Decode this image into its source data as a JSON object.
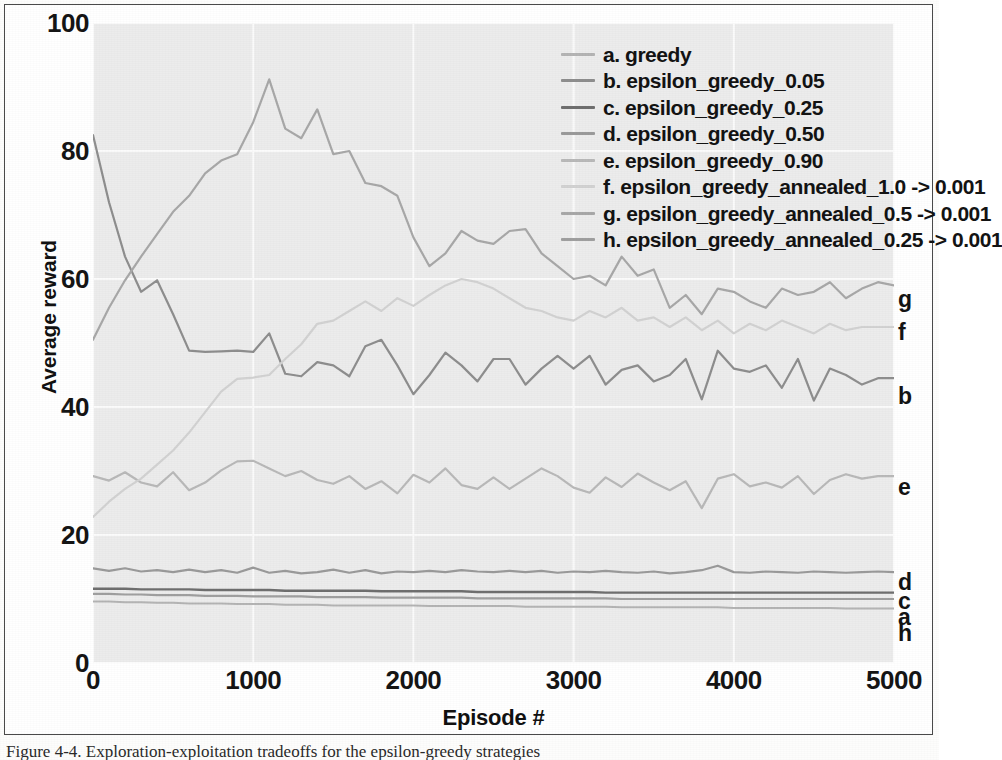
{
  "figure": {
    "caption": "Figure 4-4. Exploration-exploitation tradeoffs for the epsilon-greedy strategies"
  },
  "axes": {
    "x_title": "Episode #",
    "y_title": "Average reward",
    "x_ticks": [
      "0",
      "1000",
      "2000",
      "3000",
      "4000",
      "5000"
    ],
    "y_ticks": [
      "0",
      "20",
      "40",
      "60",
      "80",
      "100"
    ],
    "x_tick_values": [
      0,
      1000,
      2000,
      3000,
      4000,
      5000
    ],
    "y_tick_values": [
      0,
      20,
      40,
      60,
      80,
      100
    ]
  },
  "legend": {
    "entries": [
      {
        "key": "a",
        "label": "a. greedy",
        "color": "#b4b4b4"
      },
      {
        "key": "b",
        "label": "b. epsilon_greedy_0.05",
        "color": "#8e8e8e"
      },
      {
        "key": "c",
        "label": "c. epsilon_greedy_0.25",
        "color": "#6f6f6f"
      },
      {
        "key": "d",
        "label": "d. epsilon_greedy_0.50",
        "color": "#9a9a9a"
      },
      {
        "key": "e",
        "label": "e. epsilon_greedy_0.90",
        "color": "#b9b9b9"
      },
      {
        "key": "f",
        "label": "f. epsilon_greedy_annealed_1.0 -> 0.001",
        "color": "#d2d2d2"
      },
      {
        "key": "g",
        "label": "g. epsilon_greedy_annealed_0.5 -> 0.001",
        "color": "#a8a8a8"
      },
      {
        "key": "h",
        "label": "h. epsilon_greedy_annealed_0.25 -> 0.001",
        "color": "#9f9f9f"
      }
    ]
  },
  "edge_labels": [
    {
      "key": "g",
      "label": "g",
      "y": 283
    },
    {
      "key": "f",
      "label": "f",
      "y": 316
    },
    {
      "key": "b",
      "label": "b",
      "y": 380
    },
    {
      "key": "e",
      "label": "e",
      "y": 471
    },
    {
      "key": "d",
      "label": "d",
      "y": 566
    },
    {
      "key": "c",
      "label": "c",
      "y": 585
    },
    {
      "key": "a",
      "label": "a",
      "y": 601
    },
    {
      "key": "h",
      "label": "h",
      "y": 617
    }
  ],
  "chart_data": {
    "type": "line",
    "title": "",
    "xlabel": "Episode #",
    "ylabel": "Average reward",
    "xlim": [
      0,
      5000
    ],
    "ylim": [
      0,
      100
    ],
    "grid": true,
    "legend_position": "top-right-inside",
    "x": [
      0,
      100,
      200,
      300,
      400,
      500,
      600,
      700,
      800,
      900,
      1000,
      1100,
      1200,
      1300,
      1400,
      1500,
      1600,
      1700,
      1800,
      1900,
      2000,
      2100,
      2200,
      2300,
      2400,
      2500,
      2600,
      2700,
      2800,
      2900,
      3000,
      3100,
      3200,
      3300,
      3400,
      3500,
      3600,
      3700,
      3800,
      3900,
      4000,
      4100,
      4200,
      4300,
      4400,
      4500,
      4600,
      4700,
      4800,
      4900,
      5000
    ],
    "series": [
      {
        "name": "a. greedy",
        "key": "a",
        "color": "#b4b4b4",
        "width": 2.0,
        "values": [
          9.6,
          9.6,
          9.5,
          9.5,
          9.4,
          9.4,
          9.3,
          9.3,
          9.3,
          9.2,
          9.2,
          9.2,
          9.1,
          9.1,
          9.1,
          9.0,
          9.0,
          9.0,
          9.0,
          9.0,
          9.0,
          8.9,
          8.9,
          8.9,
          8.9,
          8.9,
          8.9,
          8.8,
          8.8,
          8.8,
          8.8,
          8.8,
          8.8,
          8.7,
          8.7,
          8.7,
          8.7,
          8.7,
          8.7,
          8.7,
          8.6,
          8.6,
          8.6,
          8.6,
          8.6,
          8.6,
          8.6,
          8.5,
          8.5,
          8.5,
          8.5
        ]
      },
      {
        "name": "b. epsilon_greedy_0.05",
        "key": "b",
        "color": "#8e8e8e",
        "width": 2.2,
        "values": [
          82.5,
          72.0,
          63.5,
          58.0,
          59.8,
          54.5,
          48.8,
          48.6,
          48.7,
          48.8,
          48.6,
          51.5,
          45.2,
          44.8,
          47.0,
          46.5,
          44.8,
          49.5,
          50.5,
          46.5,
          42.0,
          45.0,
          48.5,
          46.5,
          44.0,
          47.5,
          47.5,
          43.5,
          46.0,
          48.0,
          46.0,
          48.0,
          43.5,
          45.8,
          46.5,
          44.0,
          45.0,
          47.5,
          41.2,
          48.8,
          46.0,
          45.5,
          46.5,
          43.0,
          47.5,
          41.0,
          46.0,
          45.0,
          43.5,
          44.5,
          44.5
        ]
      },
      {
        "name": "c. epsilon_greedy_0.25",
        "key": "c",
        "color": "#6f6f6f",
        "width": 2.4,
        "values": [
          11.6,
          11.6,
          11.6,
          11.5,
          11.5,
          11.5,
          11.5,
          11.4,
          11.4,
          11.4,
          11.4,
          11.4,
          11.3,
          11.3,
          11.3,
          11.3,
          11.3,
          11.3,
          11.2,
          11.2,
          11.2,
          11.2,
          11.2,
          11.2,
          11.1,
          11.1,
          11.1,
          11.1,
          11.1,
          11.1,
          11.1,
          11.1,
          11.0,
          11.0,
          11.0,
          11.0,
          11.0,
          11.0,
          11.0,
          11.0,
          11.0,
          11.0,
          11.0,
          11.0,
          11.0,
          11.0,
          11.0,
          11.0,
          11.0,
          11.0,
          11.0
        ]
      },
      {
        "name": "d. epsilon_greedy_0.50",
        "key": "d",
        "color": "#9a9a9a",
        "width": 2.2,
        "values": [
          14.8,
          14.4,
          14.8,
          14.3,
          14.5,
          14.2,
          14.6,
          14.2,
          14.5,
          14.1,
          14.9,
          14.1,
          14.4,
          14.0,
          14.2,
          14.6,
          14.1,
          14.5,
          14.0,
          14.3,
          14.2,
          14.4,
          14.2,
          14.5,
          14.3,
          14.2,
          14.4,
          14.2,
          14.4,
          14.1,
          14.3,
          14.2,
          14.4,
          14.2,
          14.1,
          14.3,
          14.0,
          14.2,
          14.5,
          15.2,
          14.2,
          14.1,
          14.3,
          14.2,
          14.1,
          14.3,
          14.2,
          14.1,
          14.2,
          14.3,
          14.2
        ]
      },
      {
        "name": "e. epsilon_greedy_0.90",
        "key": "e",
        "color": "#b9b9b9",
        "width": 2.2,
        "values": [
          29.2,
          28.5,
          29.8,
          28.2,
          27.6,
          29.8,
          27.0,
          28.2,
          30.1,
          31.5,
          31.6,
          30.4,
          29.2,
          30.0,
          28.6,
          28.0,
          29.2,
          27.2,
          28.4,
          26.5,
          29.4,
          28.2,
          30.4,
          27.8,
          27.2,
          29.0,
          27.2,
          28.8,
          30.4,
          29.2,
          27.4,
          26.6,
          29.0,
          27.5,
          29.6,
          28.2,
          27.0,
          28.4,
          24.2,
          28.8,
          29.5,
          27.6,
          28.2,
          27.4,
          29.2,
          26.4,
          28.6,
          29.5,
          28.8,
          29.2,
          29.2
        ]
      },
      {
        "name": "f. epsilon_greedy_annealed_1.0 -> 0.001",
        "key": "f",
        "color": "#d2d2d2",
        "width": 2.2,
        "values": [
          22.8,
          25.2,
          27.2,
          28.8,
          31.0,
          33.2,
          36.0,
          39.2,
          42.4,
          44.4,
          44.6,
          45.0,
          47.5,
          49.8,
          53.0,
          53.5,
          55.0,
          56.5,
          55.0,
          57.0,
          55.8,
          57.5,
          59.0,
          60.0,
          59.5,
          58.5,
          57.0,
          55.5,
          55.0,
          54.0,
          53.5,
          55.0,
          54.0,
          55.5,
          53.5,
          54.0,
          52.5,
          54.0,
          52.0,
          53.5,
          51.5,
          53.0,
          52.0,
          53.5,
          52.5,
          51.5,
          53.0,
          52.0,
          52.5,
          52.5,
          52.5
        ]
      },
      {
        "name": "g. epsilon_greedy_annealed_0.5 -> 0.001",
        "key": "g",
        "color": "#a8a8a8",
        "width": 2.2,
        "values": [
          50.5,
          55.5,
          59.8,
          63.5,
          67.0,
          70.5,
          73.0,
          76.5,
          78.5,
          79.5,
          84.5,
          91.2,
          83.5,
          82.0,
          86.5,
          79.5,
          80.0,
          75.0,
          74.5,
          73.0,
          66.5,
          62.0,
          64.0,
          67.5,
          66.0,
          65.5,
          67.5,
          67.8,
          64.0,
          62.0,
          60.0,
          60.5,
          59.0,
          63.5,
          60.5,
          61.5,
          55.5,
          57.5,
          54.5,
          58.5,
          58.0,
          56.5,
          55.5,
          58.5,
          57.5,
          58.0,
          59.5,
          57.0,
          58.5,
          59.5,
          59.0
        ]
      },
      {
        "name": "h. epsilon_greedy_annealed_0.25 -> 0.001",
        "key": "h",
        "color": "#9f9f9f",
        "width": 2.2,
        "values": [
          10.8,
          10.8,
          10.7,
          10.7,
          10.6,
          10.6,
          10.6,
          10.5,
          10.5,
          10.5,
          10.4,
          10.4,
          10.4,
          10.4,
          10.3,
          10.3,
          10.3,
          10.3,
          10.2,
          10.2,
          10.2,
          10.2,
          10.2,
          10.2,
          10.1,
          10.1,
          10.1,
          10.1,
          10.1,
          10.1,
          10.1,
          10.1,
          10.1,
          10.0,
          10.0,
          10.0,
          10.0,
          10.0,
          10.0,
          10.0,
          10.0,
          10.0,
          10.0,
          10.0,
          10.0,
          10.0,
          10.0,
          10.0,
          10.0,
          10.0,
          10.0
        ]
      }
    ]
  }
}
